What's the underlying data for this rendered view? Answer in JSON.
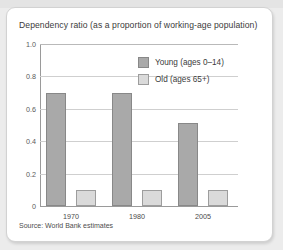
{
  "card": {
    "title": "Dependency ratio (as a proportion of working-age population)",
    "source": "Source: World Bank estimates"
  },
  "legend": {
    "items": [
      {
        "label": "Young (ages 0–14)",
        "color": "#a9a9a9",
        "key": "young"
      },
      {
        "label": "Old (ages 65+)",
        "color": "#dadada",
        "key": "old"
      }
    ]
  },
  "axis": {
    "y_ticks": [
      "1.0",
      "0.8",
      "0.6",
      "0.4",
      "0.2",
      "0"
    ],
    "x_ticks": [
      "1970",
      "1980",
      "2005"
    ]
  },
  "chart_data": {
    "type": "bar",
    "title": "Dependency ratio (as a proportion of working-age population)",
    "xlabel": "",
    "ylabel": "",
    "ylim": [
      0,
      1.0
    ],
    "ytick_values": [
      1.0,
      0.8,
      0.6,
      0.4,
      0.2,
      0
    ],
    "grid": true,
    "legend_position": "upper-right-inside",
    "categories": [
      "1970",
      "1980",
      "2005"
    ],
    "series": [
      {
        "name": "Young (ages 0–14)",
        "color": "#a9a9a9",
        "values": [
          0.7,
          0.7,
          0.51
        ]
      },
      {
        "name": "Old (ages 65+)",
        "color": "#dadada",
        "values": [
          0.1,
          0.1,
          0.1
        ]
      }
    ],
    "source": "Source: World Bank estimates"
  }
}
